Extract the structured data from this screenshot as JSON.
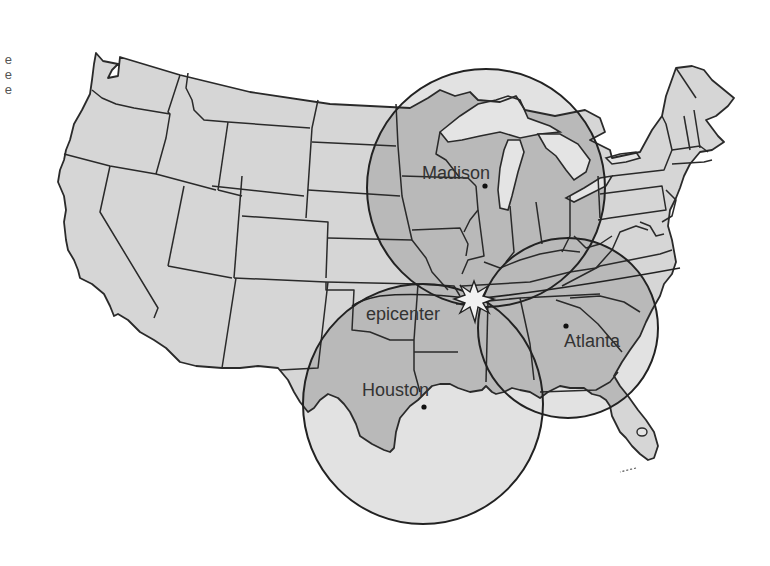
{
  "map": {
    "title": "Contiguous United States — distance from epicenter",
    "colors": {
      "background": "#ffffff",
      "land": "#d6d6d6",
      "land_in_circle": "#b9b9b9",
      "water_in_circle": "#e2e2e2",
      "lakes": "#e4e4e4",
      "border": "#2a2a2a",
      "circle_stroke": "#222222",
      "star_fill": "#f2f2f2",
      "label": "#333333"
    },
    "edge_fragment_text": [
      "e",
      "e",
      "e"
    ],
    "epicenter": {
      "label": "epicenter",
      "x": 474,
      "y": 299,
      "icon": "starburst-icon"
    },
    "cities": [
      {
        "name": "Madison",
        "label": "Madison",
        "dot_x": 485,
        "dot_y": 186,
        "label_x": 422,
        "label_y": 179
      },
      {
        "name": "Atlanta",
        "label": "Atlanta",
        "dot_x": 566,
        "dot_y": 326,
        "label_x": 564,
        "label_y": 347
      },
      {
        "name": "Houston",
        "label": "Houston",
        "dot_x": 424,
        "dot_y": 407,
        "label_x": 362,
        "label_y": 396
      }
    ],
    "circles": [
      {
        "name": "madison-radius-circle",
        "cx": 486,
        "cy": 188,
        "r": 119
      },
      {
        "name": "atlanta-radius-circle",
        "cx": 568,
        "cy": 328,
        "r": 90
      },
      {
        "name": "houston-radius-circle",
        "cx": 423,
        "cy": 404,
        "r": 120
      }
    ]
  }
}
